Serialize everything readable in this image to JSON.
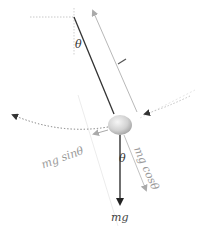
{
  "diagram": {
    "labels": {
      "length": "l",
      "theta_top": "θ",
      "theta_bottom": "θ",
      "weight": "mg",
      "tangential": "mg sinθ",
      "radial": "mg cosθ"
    },
    "colors": {
      "string": "#333333",
      "weight_arrow": "#222222",
      "component_arrow": "#b8b8b8",
      "guide_dotted": "#c8c8c8",
      "arc_dotted": "#777777",
      "label_dark": "#333333",
      "label_light": "#9a9a9a",
      "bob_light": "#f4f4f4",
      "bob_dark": "#a9a9a9"
    }
  }
}
